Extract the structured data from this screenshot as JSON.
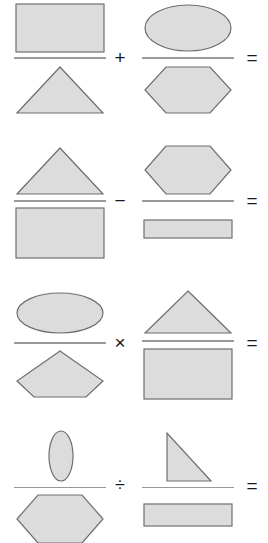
{
  "worksheet": {
    "title": "Shape fraction expressions",
    "fill_color": "#dcdcdc",
    "stroke_color": "#6e6e6e",
    "bar_color": "#9a9a9a",
    "background_color": "#ffffff",
    "operator_color": "#1a1a1a",
    "rows": [
      {
        "id": "row-1",
        "operator": "+",
        "operator_name": "plus-operator",
        "equals": "=",
        "left_fraction": {
          "numerator": "rectangle",
          "denominator": "triangle"
        },
        "right_fraction": {
          "numerator": "ellipse",
          "denominator": "hexagon"
        }
      },
      {
        "id": "row-2",
        "operator": "−",
        "operator_name": "minus-operator",
        "equals": "=",
        "left_fraction": {
          "numerator": "triangle",
          "denominator": "rectangle"
        },
        "right_fraction": {
          "numerator": "hexagon",
          "denominator": "thin-rectangle"
        }
      },
      {
        "id": "row-3",
        "operator": "×",
        "operator_name": "multiply-operator",
        "equals": "=",
        "left_fraction": {
          "numerator": "ellipse",
          "denominator": "pentagon"
        },
        "right_fraction": {
          "numerator": "triangle",
          "denominator": "rectangle"
        }
      },
      {
        "id": "row-4",
        "operator": "÷",
        "operator_name": "divide-operator",
        "equals": "=",
        "left_fraction": {
          "numerator": "narrow-ellipse",
          "denominator": "hexagon"
        },
        "right_fraction": {
          "numerator": "right-triangle",
          "denominator": "thin-rectangle"
        }
      }
    ]
  }
}
